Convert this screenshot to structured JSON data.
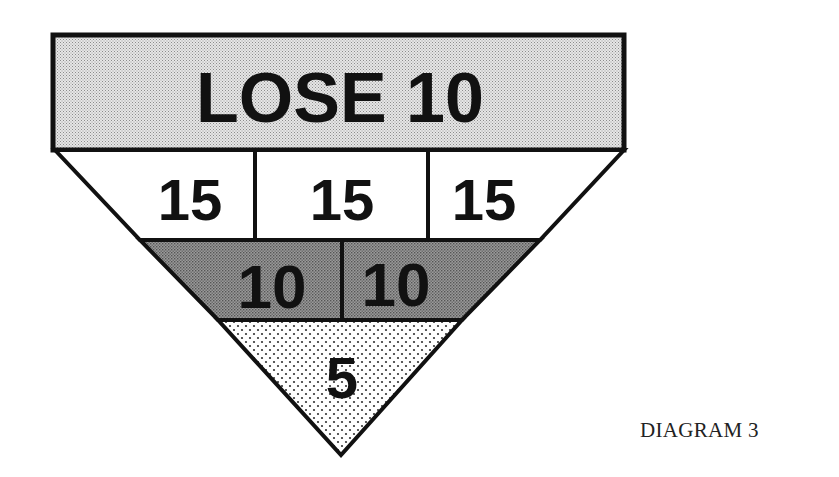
{
  "diagram": {
    "caption": "DIAGRAM 3",
    "header": {
      "label": "LOSE 10",
      "fill": "#d4d4d4"
    },
    "rows": [
      {
        "name": "row-15",
        "fill": "#ffffff",
        "cells": [
          "15",
          "15",
          "15"
        ]
      },
      {
        "name": "row-10",
        "fill": "#8a8a8a",
        "cells": [
          "10",
          "10"
        ]
      },
      {
        "name": "row-5",
        "fill": "#ececec",
        "cells": [
          "5"
        ]
      }
    ],
    "stroke_color": "#111111"
  }
}
